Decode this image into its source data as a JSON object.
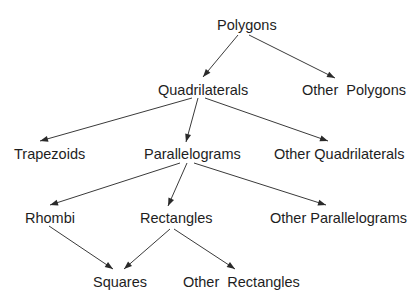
{
  "diagram": {
    "type": "tree",
    "title": "",
    "nodes": [
      {
        "id": "polygons",
        "label": "Polygons"
      },
      {
        "id": "quadrilaterals",
        "label": "Quadrilaterals"
      },
      {
        "id": "other_polygons",
        "label": "Other  Polygons"
      },
      {
        "id": "trapezoids",
        "label": "Trapezoids"
      },
      {
        "id": "parallelograms",
        "label": "Parallelograms"
      },
      {
        "id": "other_quadrilaterals",
        "label": "Other Quadrilaterals"
      },
      {
        "id": "rhombi",
        "label": "Rhombi"
      },
      {
        "id": "rectangles",
        "label": "Rectangles"
      },
      {
        "id": "other_parallelograms",
        "label": "Other Parallelograms"
      },
      {
        "id": "squares",
        "label": "Squares"
      },
      {
        "id": "other_rectangles",
        "label": "Other  Rectangles"
      }
    ],
    "edges": [
      {
        "from": "polygons",
        "to": "quadrilaterals"
      },
      {
        "from": "polygons",
        "to": "other_polygons"
      },
      {
        "from": "quadrilaterals",
        "to": "trapezoids"
      },
      {
        "from": "quadrilaterals",
        "to": "parallelograms"
      },
      {
        "from": "quadrilaterals",
        "to": "other_quadrilaterals"
      },
      {
        "from": "parallelograms",
        "to": "rhombi"
      },
      {
        "from": "parallelograms",
        "to": "rectangles"
      },
      {
        "from": "parallelograms",
        "to": "other_parallelograms"
      },
      {
        "from": "rhombi",
        "to": "squares"
      },
      {
        "from": "rectangles",
        "to": "squares"
      },
      {
        "from": "rectangles",
        "to": "other_rectangles"
      }
    ]
  }
}
